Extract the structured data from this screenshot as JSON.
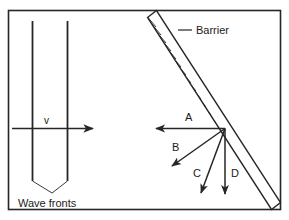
{
  "figure": {
    "border": {
      "x": 8,
      "y": 10,
      "width": 273,
      "height": 200,
      "color": "#262626"
    },
    "background": "#ffffff",
    "line_color": "#262626"
  },
  "wave_fronts": {
    "label": "Wave fronts",
    "label_x": 18,
    "label_y": 207,
    "lines": [
      {
        "x": 32,
        "y_top": 21,
        "y_bottom": 181
      },
      {
        "x": 67,
        "y_top": 21,
        "y_bottom": 181
      }
    ],
    "leaders": [
      {
        "x1": 32,
        "y1": 181,
        "x2": 52,
        "y2": 193
      },
      {
        "x1": 67,
        "y1": 181,
        "x2": 52,
        "y2": 193
      }
    ]
  },
  "velocity_arrow": {
    "label": "v",
    "label_x": 47,
    "label_y": 124,
    "x1": 12,
    "y1": 129,
    "x2": 97,
    "y2": 129
  },
  "barrier": {
    "label": "Barrier",
    "label_x": 196,
    "label_y": 34,
    "leader": {
      "x1": 178,
      "y1": 30,
      "x2": 192,
      "y2": 30
    },
    "top": {
      "x": 152,
      "y": 14
    },
    "bottom": {
      "x": 276,
      "y": 206
    },
    "band_width": 9,
    "hatch_count": 23
  },
  "incidence_point": {
    "x": 225,
    "y": 128
  },
  "rays": [
    {
      "id": "A",
      "label": "A",
      "x2": 152,
      "y2": 128,
      "label_x": 185,
      "label_y": 121
    },
    {
      "id": "B",
      "label": "B",
      "x2": 169,
      "y2": 169,
      "label_x": 177,
      "label_y": 151
    },
    {
      "id": "C",
      "label": "C",
      "x2": 199,
      "y2": 197,
      "label_x": 196,
      "label_y": 177
    },
    {
      "id": "D",
      "label": "D",
      "x2": 225,
      "y2": 198,
      "label_x": 232,
      "label_y": 177
    }
  ]
}
